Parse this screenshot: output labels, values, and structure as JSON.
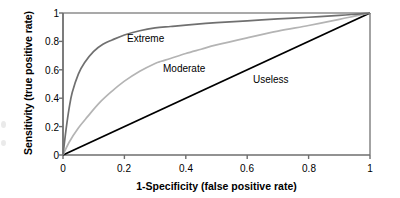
{
  "chart_data": {
    "type": "line",
    "title": "",
    "xlabel": "1-Specificity (false positive rate)",
    "ylabel": "Sensitivity (true positive rate)",
    "xlim": [
      0,
      1
    ],
    "ylim": [
      0,
      1
    ],
    "grid": false,
    "legend_position": "inline-annotations",
    "xticks": [
      "0",
      "0.2",
      "0.4",
      "0.6",
      "0.8",
      "1"
    ],
    "xtick_values": [
      0,
      0.2,
      0.4,
      0.6,
      0.8,
      1
    ],
    "yticks": [
      "0",
      "0.2",
      "0.4",
      "0.6",
      "0.8",
      "1"
    ],
    "ytick_values": [
      0,
      0.2,
      0.4,
      0.6,
      0.8,
      1
    ],
    "series": [
      {
        "name": "Extreme",
        "color": "#707070",
        "auc": 0.95,
        "x": [
          0,
          0.01,
          0.02,
          0.03,
          0.05,
          0.07,
          0.1,
          0.13,
          0.16,
          0.2,
          0.25,
          0.3,
          0.35,
          0.4,
          0.5,
          0.6,
          0.7,
          0.8,
          0.9,
          0.95,
          1.0
        ],
        "values": [
          0,
          0.18,
          0.33,
          0.44,
          0.57,
          0.65,
          0.73,
          0.78,
          0.81,
          0.845,
          0.875,
          0.895,
          0.905,
          0.915,
          0.932,
          0.945,
          0.958,
          0.97,
          0.983,
          0.991,
          1.0
        ]
      },
      {
        "name": "Moderate",
        "color": "#b4b4b4",
        "auc": 0.8,
        "x": [
          0,
          0.02,
          0.05,
          0.08,
          0.12,
          0.16,
          0.2,
          0.25,
          0.3,
          0.32,
          0.35,
          0.4,
          0.45,
          0.5,
          0.6,
          0.7,
          0.8,
          0.9,
          0.95,
          1.0
        ],
        "values": [
          0,
          0.09,
          0.19,
          0.27,
          0.37,
          0.45,
          0.52,
          0.59,
          0.645,
          0.66,
          0.68,
          0.715,
          0.745,
          0.775,
          0.825,
          0.872,
          0.912,
          0.955,
          0.978,
          1.0
        ]
      },
      {
        "name": "Useless",
        "color": "#000000",
        "auc": 0.5,
        "x": [
          0,
          1
        ],
        "values": [
          0,
          1
        ]
      }
    ],
    "annotations": [
      {
        "text": "Extreme",
        "x": 0.21,
        "y": 0.86
      },
      {
        "text": "Moderate",
        "x": 0.33,
        "y": 0.645
      },
      {
        "text": "Useless",
        "x": 0.62,
        "y": 0.575
      }
    ]
  },
  "axes": {
    "x_title": "1-Specificity (false positive rate)",
    "y_title": "Sensitivity (true positive rate)",
    "xticks": [
      "0",
      "0.2",
      "0.4",
      "0.6",
      "0.8",
      "1"
    ],
    "yticks": [
      "0",
      "0.2",
      "0.4",
      "0.6",
      "0.8",
      "1"
    ]
  },
  "labels": {
    "extreme": "Extreme",
    "moderate": "Moderate",
    "useless": "Useless"
  },
  "colors": {
    "extreme": "#707070",
    "moderate": "#b4b4b4",
    "useless": "#000000",
    "axis": "#1a1a1a",
    "frame": "#8c8c8c",
    "background": "#ffffff"
  }
}
